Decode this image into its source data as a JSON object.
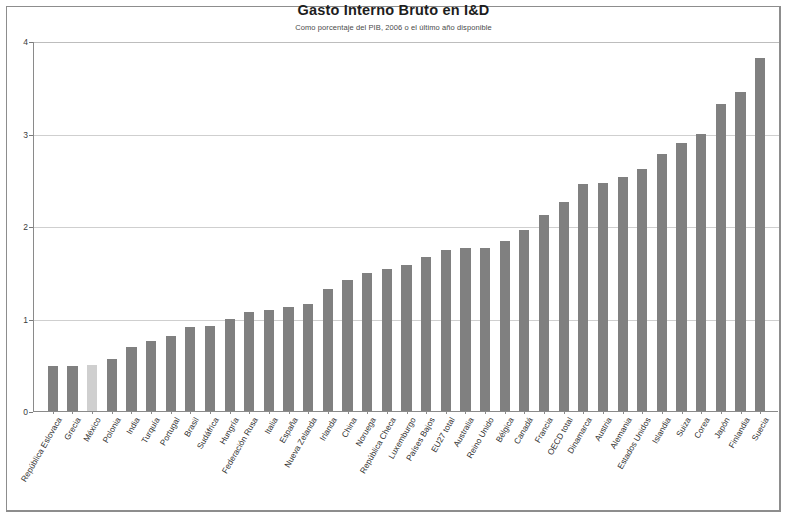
{
  "chart_data": {
    "type": "bar",
    "title": "Gasto Interno Bruto en I&D",
    "subtitle": "Como porcentaje del PIB, 2006 o el último año disponible",
    "xlabel": "",
    "ylabel": "",
    "ylim": [
      0,
      4
    ],
    "yticks": [
      0,
      1,
      2,
      3,
      4
    ],
    "ytick_labels": [
      "0",
      "1",
      "2",
      "3",
      "4"
    ],
    "grid": true,
    "legend": "none",
    "bar_color": "#808080",
    "highlight_color": "#cfcfcf",
    "highlight_category": "México",
    "categories": [
      "República Eslovaca",
      "Grecia",
      "México",
      "Polonia",
      "India",
      "Turquía",
      "Portugal",
      "Brasil",
      "Sudáfrica",
      "Hungría",
      "Federación Rusa",
      "Italia",
      "España",
      "Nueva Zelanda",
      "Irlanda",
      "China",
      "Noruega",
      "República Checa",
      "Luxemburgo",
      "Países Bajos",
      "EU27 total",
      "Australia",
      "Reino Unido",
      "Bélgica",
      "Canadá",
      "Francia",
      "OECD total",
      "Dinamarca",
      "Austria",
      "Alemania",
      "Estados Unidos",
      "Islandia",
      "Suiza",
      "Corea",
      "Japón",
      "Finlandia",
      "Suecia"
    ],
    "values": [
      0.49,
      0.49,
      0.5,
      0.56,
      0.69,
      0.76,
      0.81,
      0.91,
      0.92,
      1.0,
      1.07,
      1.09,
      1.12,
      1.16,
      1.32,
      1.42,
      1.49,
      1.54,
      1.58,
      1.67,
      1.74,
      1.76,
      1.76,
      1.84,
      1.96,
      2.12,
      2.26,
      2.45,
      2.47,
      2.53,
      2.62,
      2.78,
      2.9,
      2.99,
      3.32,
      3.45,
      3.82
    ]
  },
  "meta": {
    "ytick_count": 5
  }
}
